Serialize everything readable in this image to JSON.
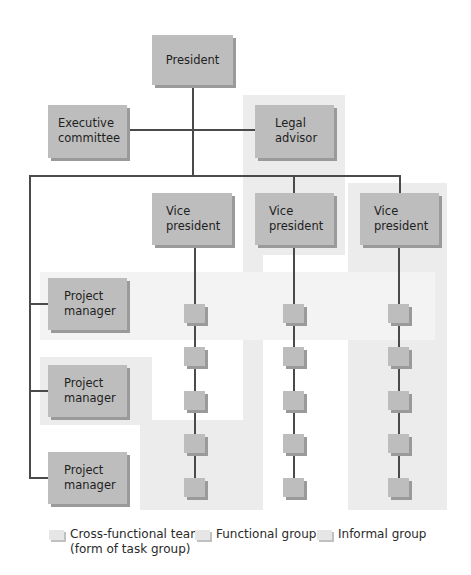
{
  "diagram": {
    "type": "organizational-chart",
    "nodes": {
      "president": "President",
      "executive_committee": [
        "Executive",
        "committee"
      ],
      "legal_advisor": [
        "Legal",
        "advisor"
      ],
      "vice_presidents": [
        [
          "Vice",
          "president"
        ],
        [
          "Vice",
          "president"
        ],
        [
          "Vice",
          "president"
        ]
      ],
      "project_managers": [
        [
          "Project",
          "manager"
        ],
        [
          "Project",
          "manager"
        ],
        [
          "Project",
          "manager"
        ]
      ],
      "subordinates_per_vp": 5
    },
    "group_types": {
      "cross_functional": "Cross-functional team",
      "functional": "Functional group",
      "informal": "Informal group"
    }
  },
  "legend": {
    "items": [
      {
        "label_line1": "Cross-functional team",
        "label_line2": "(form of task group)",
        "swatch": "#e6e6e6"
      },
      {
        "label_line1": "Functional group",
        "swatch": "#e6e6e6"
      },
      {
        "label_line1": "Informal group",
        "swatch": "#e6e6e6"
      }
    ]
  },
  "colors": {
    "box_fill": "#bdbdbd",
    "box_shadow": "#9a9a9a",
    "group_shade": "#ececec",
    "line": "#4a4a4a"
  }
}
